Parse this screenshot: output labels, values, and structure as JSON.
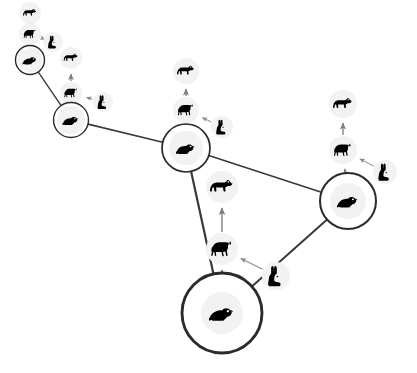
{
  "figure": {
    "type": "network-food-web-diagram",
    "background_color": "#ffffff",
    "width": 417,
    "height": 373,
    "edge_color": "#3a3a3a",
    "hub_stroke_color": "#2b2b2b",
    "species_halo_color": "#f2f2f2",
    "arrow_color": "#7d7d7d",
    "rabbit_arrow_color": "#8a8a8a",
    "silhouette_color": "#000000"
  },
  "legend_icons": {
    "rat": "rat-icon",
    "wolf": "wolf-icon",
    "bear": "bear-icon",
    "rabbit": "rabbit-icon"
  },
  "hubs": [
    {
      "id": "hub-1",
      "label": "rat",
      "icon": "rat-icon",
      "cx": 30,
      "cy": 60,
      "r": 14.5,
      "halo_r": 12,
      "icon_size": 15
    },
    {
      "id": "hub-2",
      "label": "rat",
      "icon": "rat-icon",
      "cx": 71,
      "cy": 120,
      "r": 17.5,
      "halo_r": 14,
      "icon_size": 17
    },
    {
      "id": "hub-3",
      "label": "rat",
      "icon": "rat-icon",
      "cx": 186,
      "cy": 148,
      "r": 24.0,
      "halo_r": 17,
      "icon_size": 20
    },
    {
      "id": "hub-4",
      "label": "rat",
      "icon": "rat-icon",
      "cx": 348,
      "cy": 201,
      "r": 28.0,
      "halo_r": 18,
      "icon_size": 22
    },
    {
      "id": "hub-5",
      "label": "rat",
      "icon": "rat-icon",
      "cx": 222,
      "cy": 313,
      "r": 40.0,
      "halo_r": 21,
      "icon_size": 26
    }
  ],
  "network_edges": [
    {
      "from": "hub-1",
      "to": "hub-2",
      "width": 1.4
    },
    {
      "from": "hub-2",
      "to": "hub-3",
      "width": 1.6
    },
    {
      "from": "hub-3",
      "to": "hub-4",
      "width": 1.7
    },
    {
      "from": "hub-3",
      "to": "hub-5",
      "width": 2.2
    },
    {
      "from": "hub-4",
      "to": "hub-5",
      "width": 2.0
    }
  ],
  "species_nodes": [
    {
      "id": "s1-wolf",
      "cluster": "hub-1",
      "icon": "wolf-icon",
      "cx": 30,
      "cy": 34,
      "halo_r": 11,
      "icon_size": 14
    },
    {
      "id": "s1-bear",
      "cluster": "hub-1",
      "icon": "bear-icon",
      "cx": 30,
      "cy": 13,
      "halo_r": 11,
      "icon_size": 14
    },
    {
      "id": "s1-rabbit",
      "cluster": "hub-1",
      "icon": "rabbit-icon",
      "cx": 53,
      "cy": 42,
      "halo_r": 10,
      "icon_size": 12
    },
    {
      "id": "s2-wolf",
      "cluster": "hub-2",
      "icon": "wolf-icon",
      "cx": 71,
      "cy": 93,
      "halo_r": 11,
      "icon_size": 15
    },
    {
      "id": "s2-bear",
      "cluster": "hub-2",
      "icon": "bear-icon",
      "cx": 71,
      "cy": 58,
      "halo_r": 11,
      "icon_size": 15
    },
    {
      "id": "s2-rabbit",
      "cluster": "hub-2",
      "icon": "rabbit-icon",
      "cx": 103,
      "cy": 102,
      "halo_r": 10,
      "icon_size": 13
    },
    {
      "id": "s3-wolf",
      "cluster": "hub-3",
      "icon": "wolf-icon",
      "cx": 186,
      "cy": 110,
      "halo_r": 13,
      "icon_size": 18
    },
    {
      "id": "s3-bear",
      "cluster": "hub-3",
      "icon": "bear-icon",
      "cx": 186,
      "cy": 71,
      "halo_r": 13,
      "icon_size": 18
    },
    {
      "id": "s3-rabbit",
      "cluster": "hub-3",
      "icon": "rabbit-icon",
      "cx": 222,
      "cy": 127,
      "halo_r": 11,
      "icon_size": 14
    },
    {
      "id": "s4-wolf",
      "cluster": "hub-4",
      "icon": "wolf-icon",
      "cx": 343,
      "cy": 150,
      "halo_r": 14,
      "icon_size": 20
    },
    {
      "id": "s4-bear",
      "cluster": "hub-4",
      "icon": "bear-icon",
      "cx": 343,
      "cy": 104,
      "halo_r": 14,
      "icon_size": 20
    },
    {
      "id": "s4-rabbit",
      "cluster": "hub-4",
      "icon": "rabbit-icon",
      "cx": 385,
      "cy": 172,
      "halo_r": 12,
      "icon_size": 16
    },
    {
      "id": "s5-wolf",
      "cluster": "hub-5",
      "icon": "wolf-icon",
      "cx": 222,
      "cy": 249,
      "halo_r": 16,
      "icon_size": 24
    },
    {
      "id": "s5-bear",
      "cluster": "hub-5",
      "icon": "bear-icon",
      "cx": 222,
      "cy": 187,
      "halo_r": 16,
      "icon_size": 24
    },
    {
      "id": "s5-rabbit",
      "cluster": "hub-5",
      "icon": "rabbit-icon",
      "cx": 276,
      "cy": 276,
      "halo_r": 14,
      "icon_size": 19
    }
  ],
  "trophic_arrows": [
    {
      "id": "a1-rat-wolf",
      "from": "hub-1",
      "to": "s1-wolf",
      "style": "vertical",
      "width": 1.2
    },
    {
      "id": "a1-wolf-bear",
      "from": "s1-wolf",
      "to": "s1-bear",
      "style": "vertical",
      "width": 1.2
    },
    {
      "id": "a1-rabbit-wolf",
      "from": "s1-rabbit",
      "to": "s1-wolf",
      "style": "diagonal",
      "width": 1.0
    },
    {
      "id": "a2-rat-wolf",
      "from": "hub-2",
      "to": "s2-wolf",
      "style": "vertical",
      "width": 1.2
    },
    {
      "id": "a2-wolf-bear",
      "from": "s2-wolf",
      "to": "s2-bear",
      "style": "vertical",
      "width": 1.2
    },
    {
      "id": "a2-rabbit-wolf",
      "from": "s2-rabbit",
      "to": "s2-wolf",
      "style": "diagonal",
      "width": 1.0
    },
    {
      "id": "a3-rat-wolf",
      "from": "hub-3",
      "to": "s3-wolf",
      "style": "vertical",
      "width": 1.3
    },
    {
      "id": "a3-wolf-bear",
      "from": "s3-wolf",
      "to": "s3-bear",
      "style": "vertical",
      "width": 1.3
    },
    {
      "id": "a3-rabbit-wolf",
      "from": "s3-rabbit",
      "to": "s3-wolf",
      "style": "diagonal",
      "width": 1.0
    },
    {
      "id": "a4-rat-wolf",
      "from": "hub-4",
      "to": "s4-wolf",
      "style": "vertical",
      "width": 1.3
    },
    {
      "id": "a4-wolf-bear",
      "from": "s4-wolf",
      "to": "s4-bear",
      "style": "vertical",
      "width": 1.3
    },
    {
      "id": "a4-rabbit-wolf",
      "from": "s4-rabbit",
      "to": "s4-wolf",
      "style": "diagonal",
      "width": 1.0
    },
    {
      "id": "a5-rat-wolf",
      "from": "hub-5",
      "to": "s5-wolf",
      "style": "vertical",
      "width": 1.4
    },
    {
      "id": "a5-wolf-bear",
      "from": "s5-wolf",
      "to": "s5-bear",
      "style": "vertical",
      "width": 1.4
    },
    {
      "id": "a5-rabbit-wolf",
      "from": "s5-rabbit",
      "to": "s5-wolf",
      "style": "diagonal",
      "width": 1.1
    }
  ]
}
